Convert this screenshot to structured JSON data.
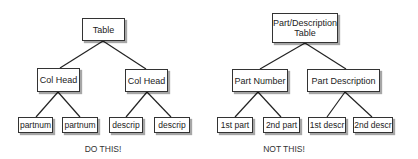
{
  "left_tree": {
    "root": "Table",
    "children": [
      {
        "label": "Col Head",
        "children": [
          "partnum",
          "partnum"
        ]
      },
      {
        "label": "Col Head",
        "children": [
          "descrip",
          "descrip"
        ]
      }
    ],
    "caption": "DO THIS!"
  },
  "right_tree": {
    "root_line1": "Part/Description",
    "root_line2": "Table",
    "children": [
      {
        "label": "Part Number",
        "children": [
          "1st part",
          "2nd part"
        ]
      },
      {
        "label": "Part Description",
        "children": [
          "1st descr",
          "2nd descr"
        ]
      }
    ],
    "caption": "NOT THIS!"
  }
}
